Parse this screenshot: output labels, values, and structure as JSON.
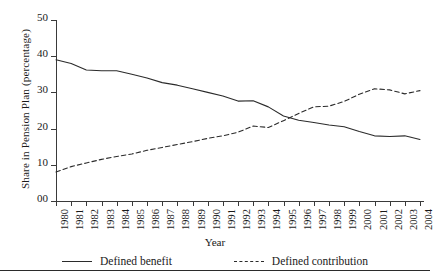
{
  "chart_data": {
    "type": "line",
    "title": "",
    "xlabel": "Year",
    "ylabel": "Share in Pension Plan (percentage)",
    "x": [
      1980,
      1981,
      1982,
      1983,
      1984,
      1985,
      1986,
      1987,
      1988,
      1989,
      1990,
      1991,
      1992,
      1993,
      1994,
      1995,
      1996,
      1997,
      1998,
      1999,
      2000,
      2001,
      2002,
      2003,
      2004
    ],
    "categories": [
      "1980",
      "1981",
      "1982",
      "1983",
      "1984",
      "1985",
      "1986",
      "1987",
      "1988",
      "1989",
      "1990",
      "1991",
      "1992",
      "1993",
      "1994",
      "1995",
      "1996",
      "1997",
      "1998",
      "1999",
      "2000",
      "2001",
      "2002",
      "2003",
      "2004"
    ],
    "series": [
      {
        "name": "Defined benefit",
        "style": "solid",
        "color": "#2b2b2b",
        "values": [
          39.0,
          38.0,
          36.2,
          36.0,
          36.0,
          35.0,
          34.0,
          32.7,
          32.0,
          31.0,
          30.0,
          29.0,
          27.6,
          27.7,
          26.0,
          23.5,
          22.3,
          21.7,
          21.0,
          20.5,
          19.2,
          18.0,
          17.8,
          18.0,
          17.0
        ]
      },
      {
        "name": "Defined contribution",
        "style": "dashed",
        "color": "#2b2b2b",
        "values": [
          8.0,
          9.5,
          10.5,
          11.5,
          12.3,
          13.0,
          14.0,
          14.8,
          15.6,
          16.4,
          17.3,
          18.0,
          19.0,
          20.7,
          20.3,
          22.2,
          24.2,
          26.0,
          26.2,
          27.5,
          29.5,
          31.0,
          30.7,
          29.6,
          30.5
        ]
      }
    ],
    "ylim": [
      0,
      50
    ],
    "yticks": [
      0,
      10,
      20,
      30,
      40,
      50
    ],
    "ytick_labels": [
      "00",
      "10",
      "20",
      "30",
      "40",
      "50"
    ],
    "grid": false,
    "legend_position": "bottom"
  },
  "legend": {
    "entries": [
      {
        "label": "Defined benefit",
        "style": "solid"
      },
      {
        "label": "Defined contribution",
        "style": "dashed"
      }
    ]
  }
}
